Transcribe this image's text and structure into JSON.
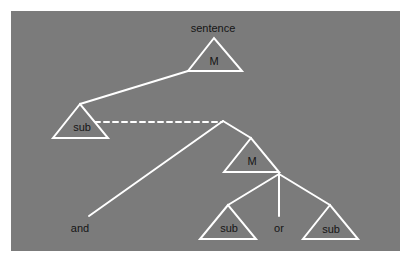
{
  "diagram": {
    "title": "sentence",
    "colors": {
      "background": "#7b7b7b",
      "lines": "#ffffff",
      "text": "#151515"
    },
    "nodes": [
      {
        "id": "root",
        "type": "triangle",
        "label": "M",
        "apex": [
          214,
          38
        ],
        "base": [
          [
            188,
            71
          ],
          [
            242,
            71
          ]
        ],
        "label_pos": [
          214,
          61
        ]
      },
      {
        "id": "sub1",
        "type": "triangle",
        "label": "sub",
        "apex": [
          80,
          104
        ],
        "base": [
          [
            53,
            138
          ],
          [
            108,
            138
          ]
        ],
        "label_pos": [
          82,
          127
        ]
      },
      {
        "id": "m2",
        "type": "triangle",
        "label": "M",
        "apex": [
          251,
          138
        ],
        "base": [
          [
            224,
            172
          ],
          [
            279,
            172
          ]
        ],
        "label_pos": [
          252,
          161
        ]
      },
      {
        "id": "sub2",
        "type": "triangle",
        "label": "sub",
        "apex": [
          228,
          205
        ],
        "base": [
          [
            200,
            239
          ],
          [
            256,
            239
          ]
        ],
        "label_pos": [
          229,
          228
        ]
      },
      {
        "id": "sub3",
        "type": "triangle",
        "label": "sub",
        "apex": [
          330,
          205
        ],
        "base": [
          [
            303,
            239
          ],
          [
            358,
            239
          ]
        ],
        "label_pos": [
          331,
          229
        ]
      }
    ],
    "words": [
      {
        "id": "and",
        "label": "and",
        "pos": [
          80,
          228
        ]
      },
      {
        "id": "or",
        "label": "or",
        "pos": [
          279,
          228
        ]
      }
    ],
    "edges": [
      {
        "from": [
          188,
          71
        ],
        "to": [
          80,
          104
        ],
        "style": "solid"
      },
      {
        "from": [
          95,
          122
        ],
        "to": [
          222,
          122
        ],
        "style": "dashed"
      },
      {
        "from": [
          223,
          121
        ],
        "to": [
          89,
          216
        ],
        "style": "solid"
      },
      {
        "from": [
          223,
          121
        ],
        "to": [
          251,
          138
        ],
        "style": "solid"
      },
      {
        "from": [
          279,
          174
        ],
        "to": [
          228,
          205
        ],
        "style": "solid"
      },
      {
        "from": [
          279,
          174
        ],
        "to": [
          279,
          216
        ],
        "style": "solid"
      },
      {
        "from": [
          279,
          174
        ],
        "to": [
          330,
          205
        ],
        "style": "solid"
      }
    ]
  }
}
